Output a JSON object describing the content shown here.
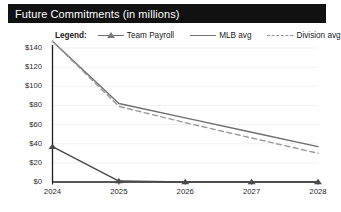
{
  "window": {
    "title": "Future Commitments (in millions)"
  },
  "legend": {
    "label": "Legend:",
    "items": [
      {
        "name": "Team Payroll",
        "marker": "triangle-line-marker",
        "color": "#6f6f6f",
        "style": "solid-with-marker"
      },
      {
        "name": "MLB avg",
        "marker": "solid-line-swatch",
        "color": "#707070",
        "style": "solid"
      },
      {
        "name": "Division avg",
        "marker": "dashed-line-swatch",
        "color": "#909090",
        "style": "dashed"
      }
    ]
  },
  "chart_data": {
    "type": "line",
    "title": "Future Commitments (in millions)",
    "xlabel": "",
    "ylabel": "",
    "x": [
      "2024",
      "2025",
      "2026",
      "2027",
      "2028"
    ],
    "categories": [
      "2024",
      "2025",
      "2026",
      "2027",
      "2028"
    ],
    "series": [
      {
        "name": "Team Payroll",
        "values": [
          37,
          1,
          0,
          0,
          0
        ],
        "style": "solid",
        "marker": "triangle",
        "color": "#4a4a4a"
      },
      {
        "name": "MLB avg",
        "values": [
          147,
          82,
          67,
          52,
          37
        ],
        "style": "solid",
        "marker": "none",
        "color": "#6e6e6e"
      },
      {
        "name": "Division avg",
        "values": [
          147,
          79,
          62,
          46,
          30
        ],
        "style": "dashed",
        "marker": "none",
        "color": "#9a9a9a"
      }
    ],
    "ylim": [
      0,
      140
    ],
    "ytick_values": [
      0,
      20,
      40,
      60,
      80,
      100,
      120,
      140
    ],
    "ytick_labels": [
      "$0",
      "$20",
      "$40",
      "$60",
      "$80",
      "$100",
      "$120",
      "$140"
    ],
    "xtick_labels": [
      "2024",
      "2025",
      "2026",
      "2027",
      "2028"
    ],
    "grid": true,
    "grid_color": "#f1f1f1",
    "legend_position": "top",
    "axis_color": "#1f1f1f",
    "background": "#ffffff"
  }
}
